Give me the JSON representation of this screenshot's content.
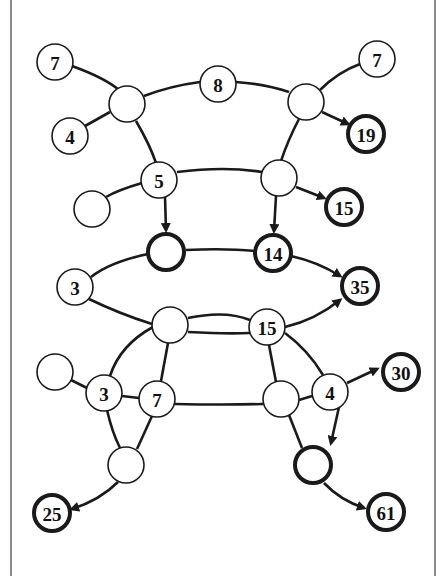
{
  "diagram": {
    "type": "puzzle-graph",
    "colors": {
      "stroke": "#1a1a1a",
      "fill": "#ffffff",
      "border": "#8a8a8a"
    },
    "nodes": [
      {
        "id": "n7a",
        "label": "7",
        "x": 55,
        "y": 62,
        "bold": false
      },
      {
        "id": "n4a",
        "label": "4",
        "x": 70,
        "y": 136,
        "bold": false
      },
      {
        "id": "hubA",
        "label": "",
        "x": 127,
        "y": 104,
        "bold": false
      },
      {
        "id": "n8",
        "label": "8",
        "x": 218,
        "y": 84,
        "bold": false
      },
      {
        "id": "hubB",
        "label": "",
        "x": 306,
        "y": 102,
        "bold": false
      },
      {
        "id": "n7b",
        "label": "7",
        "x": 377,
        "y": 59,
        "bold": false
      },
      {
        "id": "n19",
        "label": "19",
        "x": 366,
        "y": 134,
        "bold": true
      },
      {
        "id": "n5",
        "label": "5",
        "x": 159,
        "y": 180,
        "bold": false
      },
      {
        "id": "e1",
        "label": "",
        "x": 92,
        "y": 209,
        "bold": false
      },
      {
        "id": "hubC",
        "label": "",
        "x": 279,
        "y": 178,
        "bold": false
      },
      {
        "id": "n15a",
        "label": "15",
        "x": 344,
        "y": 207,
        "bold": true
      },
      {
        "id": "b1",
        "label": "",
        "x": 166,
        "y": 252,
        "bold": true
      },
      {
        "id": "n14",
        "label": "14",
        "x": 273,
        "y": 253,
        "bold": true
      },
      {
        "id": "n3a",
        "label": "3",
        "x": 75,
        "y": 287,
        "bold": false
      },
      {
        "id": "n35",
        "label": "35",
        "x": 360,
        "y": 286,
        "bold": true
      },
      {
        "id": "hubD",
        "label": "",
        "x": 170,
        "y": 325,
        "bold": false
      },
      {
        "id": "n15b",
        "label": "15",
        "x": 267,
        "y": 327,
        "bold": false
      },
      {
        "id": "e2",
        "label": "",
        "x": 55,
        "y": 372,
        "bold": false
      },
      {
        "id": "n3b",
        "label": "3",
        "x": 104,
        "y": 393,
        "bold": false
      },
      {
        "id": "n7c",
        "label": "7",
        "x": 157,
        "y": 399,
        "bold": false
      },
      {
        "id": "hubE",
        "label": "",
        "x": 281,
        "y": 399,
        "bold": false
      },
      {
        "id": "n4b",
        "label": "4",
        "x": 330,
        "y": 392,
        "bold": false
      },
      {
        "id": "n30",
        "label": "30",
        "x": 401,
        "y": 372,
        "bold": true
      },
      {
        "id": "e3",
        "label": "",
        "x": 126,
        "y": 465,
        "bold": false
      },
      {
        "id": "b2",
        "label": "",
        "x": 313,
        "y": 465,
        "bold": true
      },
      {
        "id": "n25",
        "label": "25",
        "x": 52,
        "y": 513,
        "bold": true
      },
      {
        "id": "n61",
        "label": "61",
        "x": 386,
        "y": 512,
        "bold": true
      }
    ],
    "edges": [
      {
        "from": "n7a",
        "to": "hubA",
        "path": "M72,66 Q105,78 119,90",
        "arrow": false
      },
      {
        "from": "n4a",
        "to": "hubA",
        "path": "M85,126 L110,112",
        "arrow": false
      },
      {
        "from": "hubA",
        "to": "n8",
        "path": "M144,96 Q170,86 200,82",
        "arrow": false
      },
      {
        "from": "n8",
        "to": "hubB",
        "path": "M236,82 Q265,84 289,92",
        "arrow": false
      },
      {
        "from": "hubB",
        "to": "n7b",
        "path": "M320,90 Q338,72 360,64",
        "arrow": false
      },
      {
        "from": "hubB",
        "to": "n19",
        "path": "M322,112 L348,124",
        "arrow": true
      },
      {
        "from": "hubA",
        "to": "n5",
        "path": "M136,121 Q150,145 156,163",
        "arrow": false
      },
      {
        "from": "hubB",
        "to": "hubC",
        "path": "M299,119 Q288,140 281,161",
        "arrow": false
      },
      {
        "from": "n5",
        "to": "e1",
        "path": "M142,183 Q118,190 106,197",
        "arrow": false
      },
      {
        "from": "n5",
        "to": "hubC",
        "path": "M177,172 Q225,166 262,172",
        "arrow": false
      },
      {
        "from": "hubC",
        "to": "n15a",
        "path": "M296,187 L324,198",
        "arrow": true
      },
      {
        "from": "n5",
        "to": "b1",
        "path": "M165,197 L166,230",
        "arrow": true
      },
      {
        "from": "hubC",
        "to": "n14",
        "path": "M276,196 L274,231",
        "arrow": true
      },
      {
        "from": "b1",
        "to": "n14",
        "path": "M186,250 Q225,248 255,251",
        "arrow": false
      },
      {
        "from": "n14",
        "to": "n35",
        "path": "M291,256 Q318,262 340,276",
        "arrow": true
      },
      {
        "from": "b1",
        "to": "n3a",
        "path": "M148,254 Q110,262 91,277",
        "arrow": false
      },
      {
        "from": "n3a",
        "to": "hubD",
        "path": "M89,299 Q120,314 152,324",
        "arrow": false
      },
      {
        "from": "hubD",
        "to": "n15b",
        "path": "M188,318 Q225,310 250,320",
        "arrow": false
      },
      {
        "from": "hubD",
        "to": "n15b",
        "path": "M188,332 Q225,334 250,333",
        "arrow": false
      },
      {
        "from": "n15b",
        "to": "n35",
        "path": "M285,327 Q315,320 340,300",
        "arrow": true
      },
      {
        "from": "hubD",
        "to": "n3b",
        "path": "M153,327 Q120,345 110,376",
        "arrow": false
      },
      {
        "from": "hubD",
        "to": "n7c",
        "path": "M168,343 L161,381",
        "arrow": false
      },
      {
        "from": "n15b",
        "to": "hubE",
        "path": "M269,345 L276,382",
        "arrow": false
      },
      {
        "from": "n15b",
        "to": "n4b",
        "path": "M285,333 Q308,350 323,375",
        "arrow": false
      },
      {
        "from": "e2",
        "to": "n3b",
        "path": "M71,380 L87,388",
        "arrow": false
      },
      {
        "from": "n3b",
        "to": "n7c",
        "path": "M122,396 L139,398",
        "arrow": false
      },
      {
        "from": "n7c",
        "to": "hubE",
        "path": "M175,404 Q225,405 263,404",
        "arrow": false
      },
      {
        "from": "hubE",
        "to": "n4b",
        "path": "M299,400 L312,396",
        "arrow": false
      },
      {
        "from": "n4b",
        "to": "n30",
        "path": "M347,383 L377,369",
        "arrow": true
      },
      {
        "from": "n4b",
        "to": "b2",
        "path": "M339,407 L331,443",
        "arrow": true
      },
      {
        "from": "n3b",
        "to": "e3",
        "path": "M107,410 Q112,432 120,448",
        "arrow": false
      },
      {
        "from": "n7c",
        "to": "e3",
        "path": "M152,416 L137,449",
        "arrow": false
      },
      {
        "from": "hubE",
        "to": "b2",
        "path": "M289,415 L302,448",
        "arrow": false
      },
      {
        "from": "e3",
        "to": "n25",
        "path": "M118,482 Q100,500 72,509",
        "arrow": true
      },
      {
        "from": "b2",
        "to": "n61",
        "path": "M324,483 Q340,500 364,508",
        "arrow": true
      }
    ]
  }
}
